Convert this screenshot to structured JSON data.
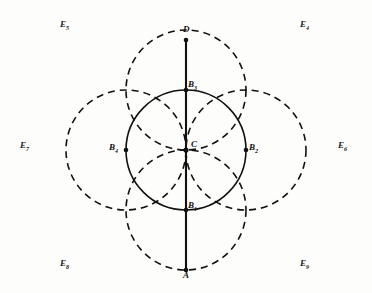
{
  "figure": {
    "title": "",
    "background_color": "#fdfdfc",
    "stroke_color": "#111111",
    "center": {
      "label": "C",
      "x": 186,
      "y": 150
    },
    "radius": 60,
    "axis_line": {
      "name": "vertical-diameter-line",
      "top_point": "D",
      "bottom_point": "A",
      "top_y": 40,
      "bottom_y": 270,
      "x": 186
    },
    "solid_circle": {
      "name": "central-circle",
      "cx": 186,
      "cy": 150,
      "r": 60,
      "style": "solid"
    },
    "dashed_circles": [
      {
        "name": "circle-B1-left",
        "center_label": "B",
        "center_sub": "1",
        "cx": 126,
        "cy": 150,
        "r": 60,
        "style": "dashed"
      },
      {
        "name": "circle-B2-right",
        "center_label": "B",
        "center_sub": "2",
        "cx": 246,
        "cy": 150,
        "r": 60,
        "style": "dashed"
      },
      {
        "name": "circle-B3-top",
        "center_label": "B",
        "center_sub": "3",
        "cx": 186,
        "cy": 90,
        "r": 60,
        "style": "dashed"
      },
      {
        "name": "circle-B4-bottom",
        "center_label": "B",
        "center_sub": "4",
        "cx": 186,
        "cy": 210,
        "r": 60,
        "style": "dashed"
      }
    ],
    "points": [
      {
        "name": "point-D",
        "label": "D",
        "sub": "",
        "x": 186,
        "y": 40,
        "label_x": 183,
        "label_y": 26,
        "dot": true
      },
      {
        "name": "point-A",
        "label": "A",
        "sub": "",
        "x": 186,
        "y": 270,
        "label_x": 183,
        "label_y": 272,
        "dot": true
      },
      {
        "name": "point-C",
        "label": "C",
        "sub": "",
        "x": 186,
        "y": 150,
        "label_x": 192,
        "label_y": 141,
        "dot": true
      },
      {
        "name": "point-B3",
        "label": "B",
        "sub": "3",
        "x": 186,
        "y": 90,
        "label_x": 189,
        "label_y": 81,
        "dot": true
      },
      {
        "name": "point-B1",
        "label": "B",
        "sub": "1",
        "x": 186,
        "y": 210,
        "label_x": 189,
        "label_y": 202,
        "dot": true
      },
      {
        "name": "point-Bleft",
        "label": "B",
        "sub": "4",
        "x": 126,
        "y": 150,
        "label_x": 110,
        "label_y": 144,
        "dot": true
      },
      {
        "name": "point-Bright",
        "label": "B",
        "sub": "2",
        "x": 246,
        "y": 150,
        "label_x": 249,
        "label_y": 144,
        "dot": true
      }
    ],
    "regions": [
      {
        "name": "region-label-E5",
        "label": "E",
        "sub": "5",
        "x": 60,
        "y": 21
      },
      {
        "name": "region-label-E4",
        "label": "E",
        "sub": "4",
        "x": 298,
        "y": 21
      },
      {
        "name": "region-label-E7",
        "label": "E",
        "sub": "7",
        "x": 20,
        "y": 140
      },
      {
        "name": "region-label-E6",
        "label": "E",
        "sub": "6",
        "x": 338,
        "y": 140
      },
      {
        "name": "region-label-E8",
        "label": "E",
        "sub": "8",
        "x": 60,
        "y": 260
      },
      {
        "name": "region-label-E9",
        "label": "E",
        "sub": "9",
        "x": 298,
        "y": 260
      }
    ]
  }
}
